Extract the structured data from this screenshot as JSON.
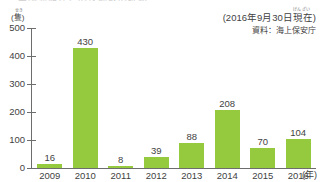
{
  "title_strip": "中国漁船などの送検数の推移",
  "y_axis": {
    "unit": "(隻)",
    "unit_ruby": "せき",
    "ticks": [
      0,
      100,
      200,
      300,
      400,
      500
    ],
    "min": 0,
    "max": 500
  },
  "x_axis": {
    "unit": "(年)",
    "labels": [
      "2009",
      "2010",
      "2011",
      "2012",
      "2013",
      "2014",
      "2015",
      "2016"
    ]
  },
  "annotation": {
    "as_of": "(2016年9月30日現在)",
    "as_of_ruby": "げんざい",
    "source": "資料：海上保安庁"
  },
  "colors": {
    "bar": "#95ca3e",
    "axis": "#6d6d6d",
    "text": "#3f3f3f",
    "background": "#ffffff"
  },
  "chart_data": {
    "type": "bar",
    "title": "",
    "xlabel": "(年)",
    "ylabel": "(隻)",
    "categories": [
      "2009",
      "2010",
      "2011",
      "2012",
      "2013",
      "2014",
      "2015",
      "2016"
    ],
    "values": [
      16,
      430,
      8,
      39,
      88,
      208,
      70,
      104
    ],
    "value_labels": [
      "16",
      "430",
      "8",
      "39",
      "88",
      "208",
      "70",
      "104"
    ],
    "ylim": [
      0,
      500
    ],
    "yticks": [
      0,
      100,
      200,
      300,
      400,
      500
    ],
    "grid": false,
    "legend": null,
    "annotations": [
      "(2016年9月30日現在)",
      "資料：海上保安庁"
    ]
  }
}
